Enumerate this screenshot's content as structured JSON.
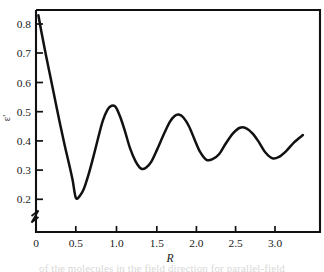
{
  "figure": {
    "background_color": "#ffffff",
    "line_color": "#111111",
    "axis_color": "#111111",
    "caption_fragment": "of the molecules in the field direction for parallel-field"
  },
  "chart_data": {
    "type": "line",
    "title": "",
    "xlabel": "R",
    "ylabel": "ε'",
    "xlim": [
      0,
      3.35
    ],
    "ylim": [
      0.155,
      0.855
    ],
    "grid": false,
    "legend": null,
    "axis_break": {
      "axis": "y",
      "note": "zigzag break symbol on vertical axis below 0.2"
    },
    "xticks": [
      0,
      0.5,
      1.0,
      1.5,
      2.0,
      2.5,
      3.0
    ],
    "xtick_labels": [
      "0",
      "0.5",
      "1.0",
      "1.5",
      "2.0",
      "2.5",
      "3.0"
    ],
    "yticks": [
      0.2,
      0.3,
      0.4,
      0.5,
      0.6,
      0.7,
      0.8
    ],
    "ytick_labels": [
      "0.2",
      "0.3",
      "0.4",
      "0.5",
      "0.6",
      "0.7",
      "0.8"
    ],
    "series": [
      {
        "name": "ε'(R)",
        "x": [
          0.03,
          0.07,
          0.12,
          0.18,
          0.24,
          0.3,
          0.36,
          0.42,
          0.46,
          0.5,
          0.55,
          0.6,
          0.66,
          0.72,
          0.78,
          0.84,
          0.9,
          0.95,
          1.0,
          1.06,
          1.12,
          1.18,
          1.25,
          1.32,
          1.38,
          1.45,
          1.52,
          1.6,
          1.68,
          1.74,
          1.79,
          1.85,
          1.92,
          1.99,
          2.06,
          2.14,
          2.22,
          2.3,
          2.38,
          2.47,
          2.56,
          2.64,
          2.72,
          2.8,
          2.88,
          2.97,
          3.05,
          3.14,
          3.24,
          3.35
        ],
        "y": [
          0.83,
          0.77,
          0.7,
          0.62,
          0.54,
          0.46,
          0.385,
          0.315,
          0.265,
          0.205,
          0.212,
          0.235,
          0.285,
          0.345,
          0.41,
          0.47,
          0.508,
          0.52,
          0.516,
          0.48,
          0.43,
          0.375,
          0.33,
          0.305,
          0.308,
          0.33,
          0.37,
          0.42,
          0.465,
          0.485,
          0.49,
          0.48,
          0.45,
          0.405,
          0.362,
          0.335,
          0.338,
          0.355,
          0.39,
          0.425,
          0.445,
          0.443,
          0.425,
          0.395,
          0.36,
          0.34,
          0.345,
          0.365,
          0.395,
          0.42
        ]
      }
    ],
    "annotations": [
      {
        "label": "initial value",
        "x": 0.03,
        "y": 0.83
      },
      {
        "label": "first minimum",
        "x": 0.5,
        "y": 0.205
      },
      {
        "label": "first maximum",
        "x": 0.95,
        "y": 0.52
      },
      {
        "label": "second minimum",
        "x": 1.32,
        "y": 0.305
      },
      {
        "label": "second maximum",
        "x": 1.79,
        "y": 0.49
      },
      {
        "label": "third minimum",
        "x": 2.14,
        "y": 0.335
      },
      {
        "label": "third maximum",
        "x": 2.56,
        "y": 0.445
      },
      {
        "label": "fourth minimum",
        "x": 2.97,
        "y": 0.34
      },
      {
        "label": "final value",
        "x": 3.35,
        "y": 0.42
      }
    ]
  }
}
